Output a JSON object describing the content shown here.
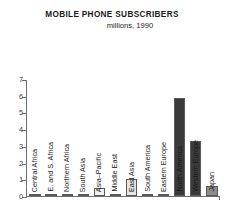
{
  "chart_data": {
    "type": "bar",
    "title": "MOBILE PHONE SUBSCRIBERS",
    "subtitle": "millions, 1990",
    "xlabel": "",
    "ylabel": "",
    "ylim": [
      0,
      7
    ],
    "yticks": [
      0,
      1,
      2,
      3,
      4,
      5,
      6,
      7
    ],
    "ytick_labels": [
      "0",
      "1",
      "2",
      "3",
      "4",
      "5",
      "6",
      "7"
    ],
    "grid": false,
    "legend": false,
    "categories": [
      "Central Africa",
      "E. and S. Africa",
      "Northern Africa",
      "South Asia",
      "Asia–Pacific",
      "Middle East",
      "East Asia",
      "South America",
      "Eastern Europe",
      "North America",
      "Western Europe",
      "Japan"
    ],
    "values": [
      0.02,
      0.03,
      0.05,
      0.05,
      0.5,
      0.12,
      1.0,
      0.1,
      0.1,
      5.9,
      3.35,
      0.6
    ],
    "bar_colors": [
      "#f2f2f2",
      "#f2f2f2",
      "#f2f2f2",
      "#f2f2f2",
      "#f0f0f0",
      "#e8e8e8",
      "#e6e6e6",
      "#e8e8e8",
      "#e8e8e8",
      "#3a3a3a",
      "#3a3a3a",
      "#8c8c8c"
    ],
    "axis_color": "#6e6e6e",
    "text_color": "#1a1a1a",
    "background": "#ffffff"
  }
}
